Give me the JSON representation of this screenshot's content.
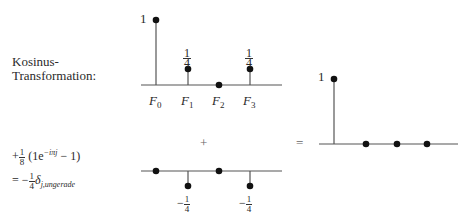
{
  "left_label": {
    "line1": "Kosinus-",
    "line2": "Transformation:"
  },
  "formula": {
    "line1_prefix": "+",
    "line1_frac_num": "1",
    "line1_frac_den": "8",
    "line1_open": "(1e",
    "line1_exp": "−iπj",
    "line1_close": " − 1)",
    "line2_prefix": "= −",
    "line2_frac_num": "1",
    "line2_frac_den": "4",
    "line2_delta": "δ",
    "line2_sub": "j,ungerade"
  },
  "operators": {
    "plus": "+",
    "equals": "="
  },
  "top_chart": {
    "y_label_one": "1",
    "stems": [
      {
        "name": "F",
        "sub": "0",
        "value": "1"
      },
      {
        "name": "F",
        "sub": "1",
        "value": "1/4",
        "num": "1",
        "den": "4"
      },
      {
        "name": "F",
        "sub": "2",
        "value": "0"
      },
      {
        "name": "F",
        "sub": "3",
        "value": "1/4",
        "num": "1",
        "den": "4"
      }
    ]
  },
  "bottom_chart": {
    "stems": [
      {
        "value": "0"
      },
      {
        "value": "-1/4",
        "sign": "−",
        "num": "1",
        "den": "4"
      },
      {
        "value": "0"
      },
      {
        "value": "-1/4",
        "sign": "−",
        "num": "1",
        "den": "4"
      }
    ]
  },
  "result_chart": {
    "y_label_one": "1",
    "stems": [
      {
        "value": "1"
      },
      {
        "value": "0"
      },
      {
        "value": "0"
      },
      {
        "value": "0"
      }
    ]
  }
}
